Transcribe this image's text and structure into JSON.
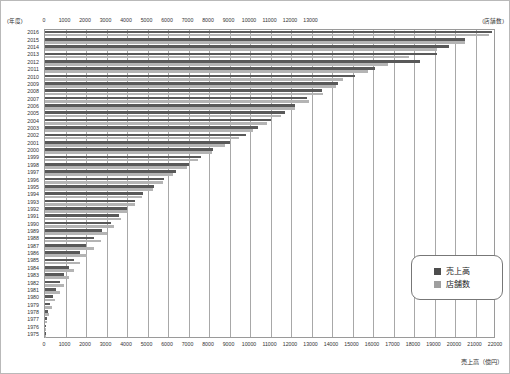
{
  "axes": {
    "year_axis_label": "(年度)",
    "store_axis_label": "(店舗数)",
    "sales_axis_label": "売上高（億円）"
  },
  "legend": {
    "sales_label": "売上高",
    "stores_label": "店舗数",
    "sales_color": "#4d4d4d",
    "stores_color": "#9f9f9f"
  },
  "chart_data": {
    "type": "bar",
    "orientation": "horizontal",
    "title": "",
    "xlabel": "売上高（億円）",
    "ylabel": "(年度)",
    "grid": true,
    "legend_position": "inside-bottom-right",
    "top_axis": {
      "name": "店舗数",
      "unit": "店舗数",
      "ticks": [
        0,
        1000,
        2000,
        3000,
        4000,
        5000,
        6000,
        7000,
        8000,
        9000,
        10000,
        11000,
        12000,
        13000
      ],
      "range": [
        0,
        13000
      ]
    },
    "bottom_axis": {
      "name": "売上高",
      "unit": "億円",
      "ticks": [
        0,
        1000,
        2000,
        3000,
        4000,
        5000,
        6000,
        7000,
        8000,
        9000,
        10000,
        11000,
        12000,
        13000,
        14000,
        15000,
        16000,
        17000,
        18000,
        19000,
        20000,
        21000,
        22000
      ],
      "range": [
        0,
        22000
      ]
    },
    "categories": [
      2016,
      2015,
      2014,
      2013,
      2012,
      2011,
      2010,
      2009,
      2008,
      2007,
      2006,
      2005,
      2004,
      2003,
      2002,
      2001,
      2000,
      1999,
      1998,
      1997,
      1996,
      1995,
      1994,
      1993,
      1992,
      1991,
      1990,
      1989,
      1988,
      1987,
      1986,
      1985,
      1984,
      1983,
      1982,
      1981,
      1980,
      1979,
      1978,
      1977,
      1976,
      1975
    ],
    "series": [
      {
        "name": "売上高",
        "unit": "億円",
        "axis": "bottom",
        "color": "#595959",
        "values": [
          21800,
          20500,
          19700,
          19100,
          18300,
          16100,
          15100,
          14300,
          13500,
          12800,
          12200,
          11700,
          11000,
          10400,
          9800,
          9000,
          8200,
          7600,
          7000,
          6400,
          5800,
          5300,
          4800,
          4400,
          4000,
          3600,
          3200,
          2800,
          2400,
          2000,
          1700,
          1400,
          1150,
          950,
          750,
          560,
          390,
          250,
          150,
          80,
          30,
          8
        ]
      },
      {
        "name": "店舗数",
        "unit": "店舗",
        "axis": "top",
        "color": "#b4b4b4",
        "values": [
          12800,
          12100,
          11300,
          10500,
          9900,
          9300,
          8600,
          8400,
          8000,
          7600,
          7200,
          6800,
          6400,
          6000,
          5600,
          5200,
          4800,
          4400,
          4100,
          3700,
          3400,
          3100,
          2800,
          2600,
          2400,
          2200,
          2000,
          1800,
          1600,
          1400,
          1200,
          1000,
          840,
          700,
          560,
          430,
          300,
          200,
          120,
          60,
          25,
          6
        ]
      }
    ]
  }
}
